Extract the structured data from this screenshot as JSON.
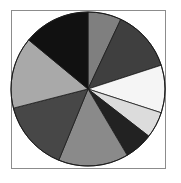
{
  "chart_data": {
    "type": "pie",
    "title": "",
    "legend": "none",
    "start_angle_deg": 0,
    "direction": "clockwise",
    "slices": [
      {
        "label": "",
        "value": 7.0,
        "color": "#7f7f7f"
      },
      {
        "label": "",
        "value": 13.0,
        "color": "#3f3f3f"
      },
      {
        "label": "",
        "value": 10.0,
        "color": "#f5f5f5"
      },
      {
        "label": "",
        "value": 5.5,
        "color": "#dcdcdc"
      },
      {
        "label": "",
        "value": 6.0,
        "color": "#222222"
      },
      {
        "label": "",
        "value": 14.7,
        "color": "#8a8a8a"
      },
      {
        "label": "",
        "value": 14.8,
        "color": "#474747"
      },
      {
        "label": "",
        "value": 15.0,
        "color": "#a9a9a9"
      },
      {
        "label": "",
        "value": 14.0,
        "color": "#111111"
      }
    ],
    "values": [
      7.0,
      13.0,
      10.0,
      5.5,
      6.0,
      14.7,
      14.8,
      15.0,
      14.0
    ],
    "geometry": {
      "cx": 88,
      "cy": 89,
      "r": 77
    }
  }
}
